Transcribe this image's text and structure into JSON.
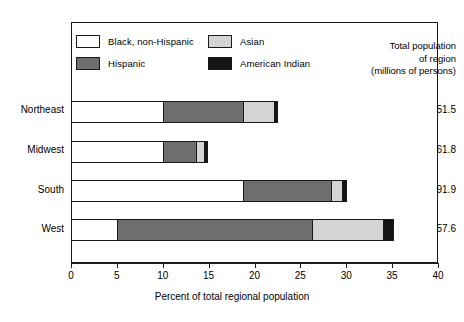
{
  "chart_data": {
    "type": "bar",
    "orientation": "horizontal",
    "stacked": true,
    "title": "",
    "xlabel": "Percent of total regional population",
    "ylabel": "",
    "xlim": [
      0,
      40
    ],
    "xticks": [
      0,
      5,
      10,
      15,
      20,
      25,
      30,
      35,
      40
    ],
    "grid": false,
    "legend_position": "top-inside",
    "categories": [
      "Northeast",
      "Midwest",
      "South",
      "West"
    ],
    "series": [
      {
        "name": "Black, non-Hispanic",
        "color": "#ffffff",
        "values": [
          10.0,
          10.0,
          18.8,
          5.0
        ]
      },
      {
        "name": "Hispanic",
        "color": "#6e6e6e",
        "values": [
          8.8,
          3.6,
          9.5,
          21.3
        ]
      },
      {
        "name": "Asian",
        "color": "#d4d4d4",
        "values": [
          3.3,
          0.9,
          1.2,
          7.7
        ]
      },
      {
        "name": "American Indian",
        "color": "#141414",
        "values": [
          0.5,
          0.4,
          0.6,
          1.2
        ]
      }
    ],
    "annotations": {
      "right_header": [
        "Total population",
        "of region",
        "(millions of persons)"
      ],
      "right_values": [
        "51.5",
        "61.8",
        "91.9",
        "57.6"
      ]
    }
  },
  "legend": {
    "items": [
      {
        "label": "Black, non-Hispanic",
        "swatch": "sw-black"
      },
      {
        "label": "Asian",
        "swatch": "sw-asian"
      },
      {
        "label": "Hispanic",
        "swatch": "sw-hisp"
      },
      {
        "label": "American Indian",
        "swatch": "sw-ai"
      }
    ]
  },
  "right_header": {
    "line1": "Total population",
    "line2": "of region",
    "line3": "(millions of persons)"
  },
  "totals": {
    "northeast": "51.5",
    "midwest": "61.8",
    "south": "91.9",
    "west": "57.6"
  },
  "categories": {
    "northeast": "Northeast",
    "midwest": "Midwest",
    "south": "South",
    "west": "West"
  },
  "xaxis": {
    "title": "Percent of total regional population",
    "ticks": [
      "0",
      "5",
      "10",
      "15",
      "20",
      "25",
      "30",
      "35",
      "40"
    ]
  }
}
